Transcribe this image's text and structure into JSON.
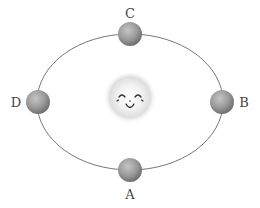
{
  "diagram": {
    "type": "orbit",
    "center_body": {
      "name": "sun",
      "expression": "smiling-face"
    },
    "orbit": {
      "shape": "ellipse",
      "cx": 130,
      "cy": 102,
      "rx": 93,
      "ry": 68,
      "stroke": "#777777"
    },
    "positions": [
      {
        "label": "A",
        "location": "bottom",
        "cx": 130,
        "cy": 170,
        "label_x": 130,
        "label_y": 199
      },
      {
        "label": "B",
        "location": "right",
        "cx": 222,
        "cy": 102,
        "label_x": 244,
        "label_y": 107
      },
      {
        "label": "C",
        "location": "top",
        "cx": 130,
        "cy": 34,
        "label_x": 130,
        "label_y": 18
      },
      {
        "label": "D",
        "location": "left",
        "cx": 38,
        "cy": 102,
        "label_x": 16,
        "label_y": 107
      }
    ],
    "colors": {
      "planet_light": "#b5b5b5",
      "planet_dark": "#6f6f6f",
      "sun_glow": "#d9d9d9",
      "label": "#444444"
    }
  }
}
